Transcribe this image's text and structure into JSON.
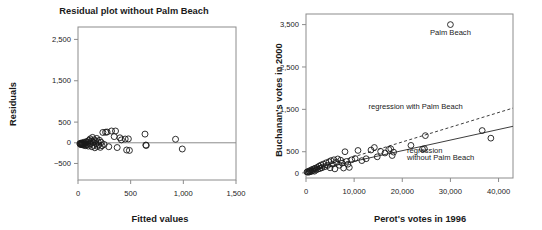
{
  "figure": {
    "background": "#ffffff",
    "ink": "#1a1a1a",
    "axis_color": "#8c8c8c"
  },
  "chart_data": [
    {
      "id": "residual-plot",
      "type": "scatter",
      "title": "Residual plot without Palm Beach",
      "xlabel": "Fitted values",
      "ylabel": "Residuals",
      "xlim": [
        0,
        1500
      ],
      "ylim": [
        -900,
        2800
      ],
      "xticks": [
        0,
        500,
        1000,
        1500
      ],
      "xtick_labels": [
        "0",
        "500",
        "1,000",
        "1,500"
      ],
      "yticks": [
        -500,
        0,
        500,
        1500,
        2500
      ],
      "ytick_labels": [
        "−500",
        "0",
        "500",
        "1,500",
        "2,500"
      ],
      "grid": false,
      "legend": "none",
      "reference_line": {
        "y": 0,
        "style": "solid"
      },
      "points": [
        {
          "x": 18,
          "y": -20
        },
        {
          "x": 22,
          "y": -35
        },
        {
          "x": 26,
          "y": -10
        },
        {
          "x": 30,
          "y": -45
        },
        {
          "x": 34,
          "y": -25
        },
        {
          "x": 38,
          "y": -5
        },
        {
          "x": 42,
          "y": -40
        },
        {
          "x": 46,
          "y": -15
        },
        {
          "x": 50,
          "y": -55
        },
        {
          "x": 54,
          "y": 10
        },
        {
          "x": 58,
          "y": -30
        },
        {
          "x": 62,
          "y": -60
        },
        {
          "x": 66,
          "y": 5
        },
        {
          "x": 70,
          "y": -20
        },
        {
          "x": 74,
          "y": -70
        },
        {
          "x": 80,
          "y": 30
        },
        {
          "x": 86,
          "y": -45
        },
        {
          "x": 92,
          "y": 20
        },
        {
          "x": 98,
          "y": -80
        },
        {
          "x": 104,
          "y": 60
        },
        {
          "x": 110,
          "y": -30
        },
        {
          "x": 116,
          "y": 95
        },
        {
          "x": 120,
          "y": -10
        },
        {
          "x": 126,
          "y": 40
        },
        {
          "x": 132,
          "y": -95
        },
        {
          "x": 138,
          "y": 130
        },
        {
          "x": 142,
          "y": 15
        },
        {
          "x": 148,
          "y": -60
        },
        {
          "x": 154,
          "y": 70
        },
        {
          "x": 160,
          "y": -120
        },
        {
          "x": 166,
          "y": 45
        },
        {
          "x": 172,
          "y": -20
        },
        {
          "x": 178,
          "y": 105
        },
        {
          "x": 184,
          "y": -85
        },
        {
          "x": 190,
          "y": 25
        },
        {
          "x": 196,
          "y": -50
        },
        {
          "x": 204,
          "y": 60
        },
        {
          "x": 212,
          "y": -110
        },
        {
          "x": 220,
          "y": 10
        },
        {
          "x": 228,
          "y": -70
        },
        {
          "x": 236,
          "y": 250
        },
        {
          "x": 248,
          "y": -40
        },
        {
          "x": 262,
          "y": 255
        },
        {
          "x": 276,
          "y": 260
        },
        {
          "x": 292,
          "y": -95
        },
        {
          "x": 318,
          "y": 285
        },
        {
          "x": 344,
          "y": 150
        },
        {
          "x": 356,
          "y": 285
        },
        {
          "x": 372,
          "y": -115
        },
        {
          "x": 398,
          "y": 120
        },
        {
          "x": 412,
          "y": 70
        },
        {
          "x": 448,
          "y": 90
        },
        {
          "x": 462,
          "y": -175
        },
        {
          "x": 478,
          "y": 95
        },
        {
          "x": 488,
          "y": -185
        },
        {
          "x": 636,
          "y": 210
        },
        {
          "x": 644,
          "y": -55
        },
        {
          "x": 648,
          "y": -65
        },
        {
          "x": 926,
          "y": 85
        },
        {
          "x": 990,
          "y": -150
        }
      ]
    },
    {
      "id": "buchanan-perot-plot",
      "type": "scatter",
      "title": "",
      "xlabel": "Perot's votes in 1996",
      "ylabel": "Buchanan's votes in 2000",
      "xlim": [
        0,
        43000
      ],
      "ylim": [
        -120,
        3750
      ],
      "xticks": [
        0,
        10000,
        20000,
        30000,
        40000
      ],
      "xtick_labels": [
        "0",
        "10,000",
        "20,000",
        "30,000",
        "40,000"
      ],
      "yticks": [
        0,
        500,
        1500,
        2500,
        3500
      ],
      "ytick_labels": [
        "0",
        "500",
        "1,500",
        "2,500",
        "3,500"
      ],
      "grid": false,
      "legend": "inline-annotations",
      "annotations": [
        {
          "id": "palm-beach-label",
          "text": "Palm Beach",
          "x": 30000,
          "y": 3250
        },
        {
          "id": "regression-with-label",
          "text": "regression with Palm Beach",
          "x": 13000,
          "y": 1500
        },
        {
          "id": "regression-without-label-1",
          "text": "regression",
          "x": 21000,
          "y": 480
        },
        {
          "id": "regression-without-label-2",
          "text": "without Palm Beach",
          "x": 21000,
          "y": 300
        }
      ],
      "series": [
        {
          "name": "regression with Palm Beach",
          "type": "line",
          "style": "dashed",
          "x": [
            0,
            43000
          ],
          "y": [
            35,
            1530
          ]
        },
        {
          "name": "regression without Palm Beach",
          "type": "line",
          "style": "solid",
          "x": [
            0,
            43000
          ],
          "y": [
            25,
            1100
          ]
        }
      ],
      "points": [
        {
          "x": 200,
          "y": 20
        },
        {
          "x": 350,
          "y": 30
        },
        {
          "x": 500,
          "y": 15
        },
        {
          "x": 650,
          "y": 45
        },
        {
          "x": 800,
          "y": 25
        },
        {
          "x": 950,
          "y": 60
        },
        {
          "x": 1100,
          "y": 35
        },
        {
          "x": 1250,
          "y": 80
        },
        {
          "x": 1400,
          "y": 50
        },
        {
          "x": 1600,
          "y": 95
        },
        {
          "x": 1750,
          "y": 40
        },
        {
          "x": 1900,
          "y": 110
        },
        {
          "x": 2100,
          "y": 70
        },
        {
          "x": 2300,
          "y": 130
        },
        {
          "x": 2500,
          "y": 90
        },
        {
          "x": 2700,
          "y": 160
        },
        {
          "x": 2900,
          "y": 105
        },
        {
          "x": 3100,
          "y": 185
        },
        {
          "x": 3300,
          "y": 120
        },
        {
          "x": 3600,
          "y": 210
        },
        {
          "x": 3900,
          "y": 145
        },
        {
          "x": 4200,
          "y": 240
        },
        {
          "x": 4500,
          "y": 175
        },
        {
          "x": 4800,
          "y": 265
        },
        {
          "x": 5000,
          "y": 120
        },
        {
          "x": 5200,
          "y": 290
        },
        {
          "x": 5500,
          "y": 205
        },
        {
          "x": 5800,
          "y": 310
        },
        {
          "x": 6000,
          "y": 95
        },
        {
          "x": 6300,
          "y": 250
        },
        {
          "x": 6600,
          "y": 330
        },
        {
          "x": 6900,
          "y": 180
        },
        {
          "x": 7200,
          "y": 300
        },
        {
          "x": 7500,
          "y": 230
        },
        {
          "x": 7800,
          "y": 115
        },
        {
          "x": 8100,
          "y": 500
        },
        {
          "x": 8400,
          "y": 270
        },
        {
          "x": 8700,
          "y": 205
        },
        {
          "x": 9000,
          "y": 130
        },
        {
          "x": 9500,
          "y": 310
        },
        {
          "x": 10200,
          "y": 340
        },
        {
          "x": 10800,
          "y": 530
        },
        {
          "x": 11600,
          "y": 290
        },
        {
          "x": 12500,
          "y": 335
        },
        {
          "x": 13500,
          "y": 540
        },
        {
          "x": 14200,
          "y": 600
        },
        {
          "x": 14800,
          "y": 380
        },
        {
          "x": 15500,
          "y": 510
        },
        {
          "x": 16400,
          "y": 470
        },
        {
          "x": 17200,
          "y": 555
        },
        {
          "x": 17600,
          "y": 570
        },
        {
          "x": 17900,
          "y": 410
        },
        {
          "x": 18200,
          "y": 490
        },
        {
          "x": 21800,
          "y": 650
        },
        {
          "x": 24200,
          "y": 560
        },
        {
          "x": 24600,
          "y": 570
        },
        {
          "x": 24800,
          "y": 880
        },
        {
          "x": 30000,
          "y": 3500
        },
        {
          "x": 36600,
          "y": 1000
        },
        {
          "x": 38400,
          "y": 820
        }
      ],
      "highlight_point": {
        "label": "Palm Beach",
        "x": 30000,
        "y": 3500
      }
    }
  ]
}
